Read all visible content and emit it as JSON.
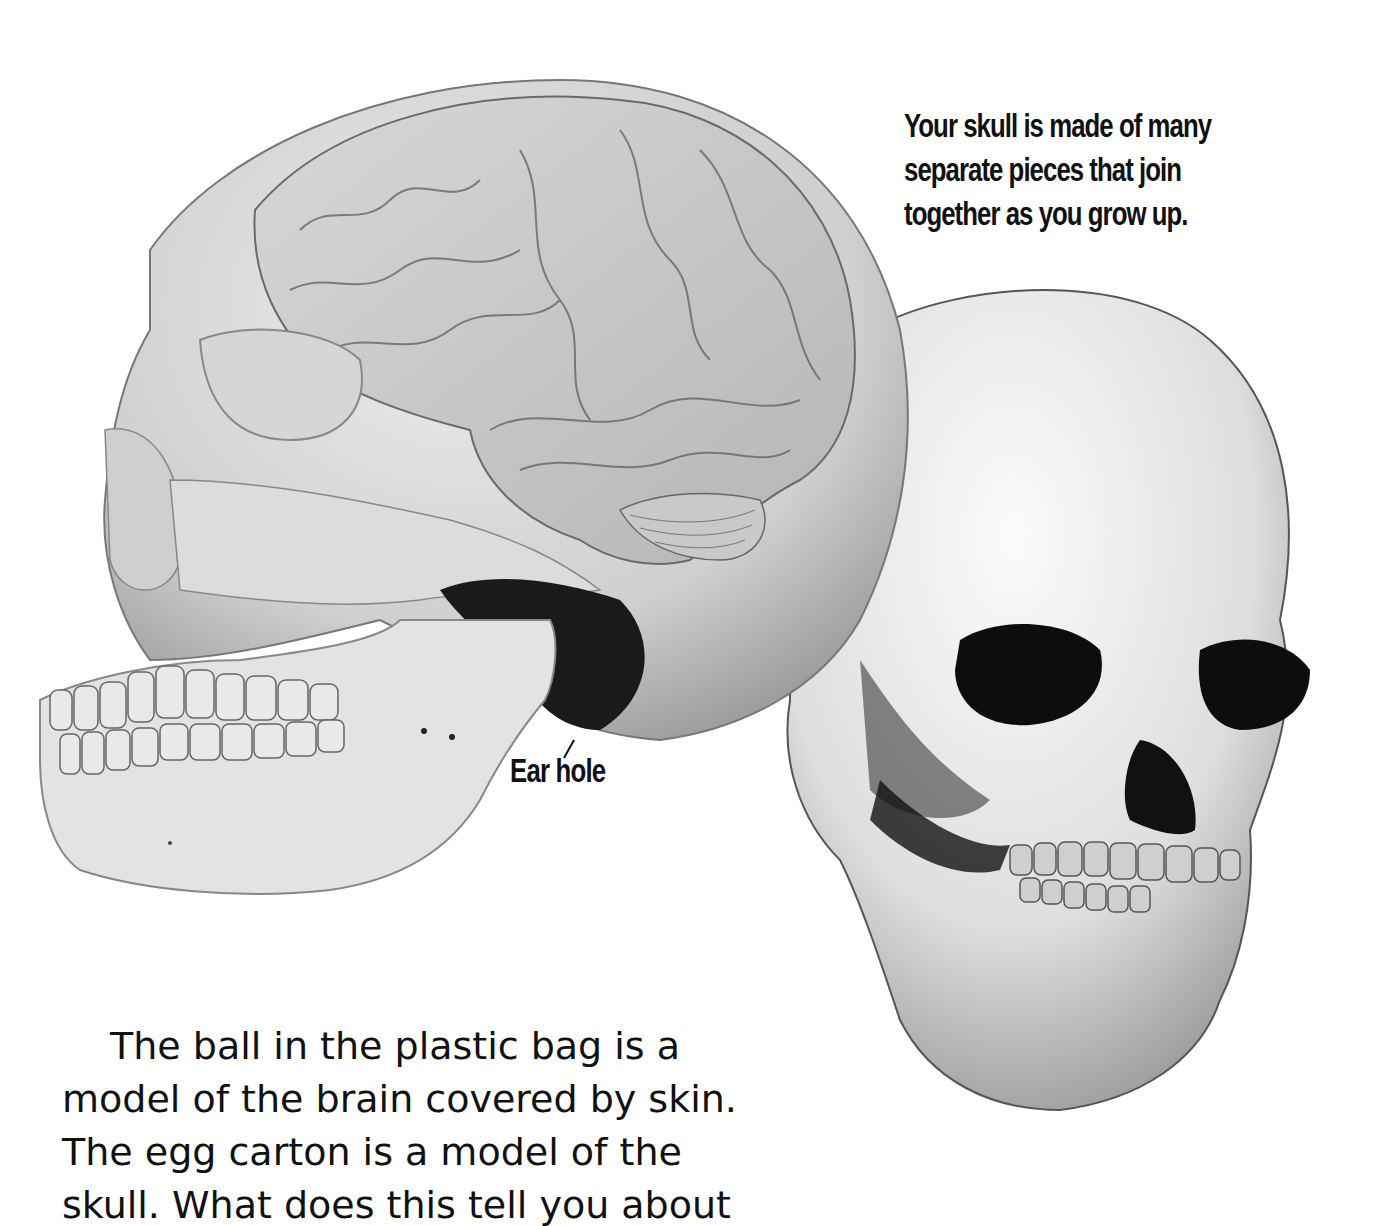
{
  "figure": {
    "caption_lines": [
      "Your skull is made of many",
      "separate pieces that join",
      "together as you grow up."
    ],
    "labels": {
      "ear_hole": "Ear hole"
    },
    "images": {
      "left": "skull-side-view-with-brain-illustration",
      "right": "skull-front-three-quarter-view"
    }
  },
  "body": {
    "lines": [
      "The ball in the plastic bag is a",
      "model of the brain covered by skin.",
      "The egg carton is a model of the",
      "skull. What does this tell you about"
    ]
  },
  "colors": {
    "background": "#ffffff",
    "text": "#111111",
    "bone_light": "#e6e6e6",
    "bone_mid": "#bdbdbd",
    "shadow": "#1a1a1a"
  }
}
